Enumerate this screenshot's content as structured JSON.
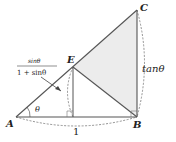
{
  "diagram": {
    "points": {
      "A": {
        "label": "A",
        "x": 16,
        "y": 117
      },
      "B": {
        "label": "B",
        "x": 137,
        "y": 117
      },
      "C": {
        "label": "C",
        "x": 137,
        "y": 10
      },
      "E": {
        "label": "E",
        "x": 73,
        "y": 67
      },
      "F": {
        "x": 73,
        "y": 117
      }
    },
    "labels": {
      "angle": "θ",
      "base": "1",
      "side_bc": "tanθ",
      "fraction_numerator": "sinθ",
      "fraction_denominator": "1 + sinθ"
    },
    "colors": {
      "stroke": "#555555",
      "shade": "#ececec",
      "dashed": "#777777"
    }
  }
}
